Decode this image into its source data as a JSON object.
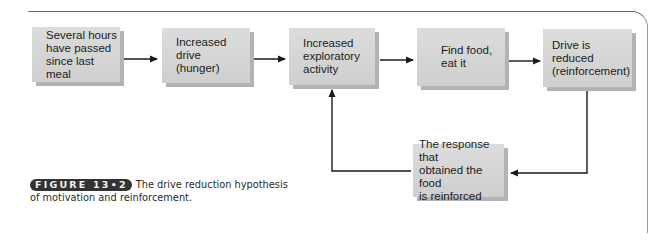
{
  "diagram": {
    "type": "flowchart",
    "nodes": [
      {
        "id": "n1",
        "label": "Several hours\nhave passed\nsince last meal"
      },
      {
        "id": "n2",
        "label": "Increased drive\n(hunger)"
      },
      {
        "id": "n3",
        "label": "Increased\nexploratory\nactivity"
      },
      {
        "id": "n4",
        "label": "Find food,\neat it"
      },
      {
        "id": "n5",
        "label": "Drive is reduced\n(reinforcement)"
      },
      {
        "id": "n6",
        "label": "The response that\nobtained the food\nis reinforced"
      }
    ],
    "edges": [
      {
        "from": "n1",
        "to": "n2"
      },
      {
        "from": "n2",
        "to": "n3"
      },
      {
        "from": "n3",
        "to": "n4"
      },
      {
        "from": "n4",
        "to": "n5"
      },
      {
        "from": "n5",
        "to": "n6"
      },
      {
        "from": "n6",
        "to": "n3"
      }
    ],
    "colors": {
      "box_fill": "#d6d6d6",
      "box_shadow": "#b3b3b3",
      "arrow": "#1a1a1a",
      "frame": "#6e6e6e",
      "badge_bg": "#333333"
    }
  },
  "caption": {
    "figure_label": "FIGURE 13•2",
    "text": "The drive reduction hypothesis of motivation and reinforcement."
  }
}
